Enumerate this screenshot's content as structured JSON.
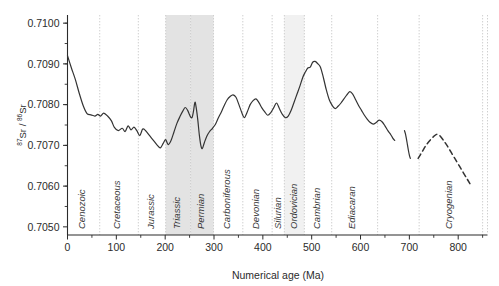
{
  "chart_data": {
    "type": "line",
    "title": "",
    "xlabel": "Numerical age (Ma)",
    "ylabel": "87Sr / 86Sr",
    "ylabel_parts": {
      "sup1": "87",
      "mid": "Sr / ",
      "sup2": "86",
      "end": "Sr"
    },
    "xlim": [
      0,
      860
    ],
    "ylim": [
      0.7048,
      0.7102
    ],
    "xticks_major": [
      0,
      100,
      200,
      300,
      400,
      500,
      600,
      700,
      800
    ],
    "xticks_major_labels": [
      "0",
      "100",
      "200",
      "300",
      "400",
      "500",
      "600",
      "700",
      "800"
    ],
    "xticks_minor": [
      50,
      150,
      250,
      350,
      450,
      550,
      650,
      750,
      850
    ],
    "yticks": [
      0.705,
      0.706,
      0.707,
      0.708,
      0.709,
      0.71
    ],
    "ytick_labels": [
      "0.7050",
      "0.7060",
      "0.7070",
      "0.7080",
      "0.7090",
      "0.7100"
    ],
    "grid": "vertical-dotted-period-boundaries",
    "legend": "none",
    "periods": [
      {
        "name": "Cenozoic",
        "start": 0,
        "end": 66,
        "shaded": false
      },
      {
        "name": "Cretaceous",
        "start": 66,
        "end": 145,
        "shaded": false
      },
      {
        "name": "Jurassic",
        "start": 145,
        "end": 201,
        "shaded": false
      },
      {
        "name": "Triassic",
        "start": 201,
        "end": 252,
        "shaded": true
      },
      {
        "name": "Permian",
        "start": 252,
        "end": 299,
        "shaded": true
      },
      {
        "name": "Carboniferous",
        "start": 299,
        "end": 359,
        "shaded": false
      },
      {
        "name": "Devonian",
        "start": 359,
        "end": 419,
        "shaded": false
      },
      {
        "name": "Silurian",
        "start": 419,
        "end": 444,
        "shaded": false
      },
      {
        "name": "Ordovician",
        "start": 444,
        "end": 485,
        "shaded": true
      },
      {
        "name": "Cambrian",
        "start": 485,
        "end": 541,
        "shaded": false
      },
      {
        "name": "Ediacaran",
        "start": 541,
        "end": 635,
        "shaded": false
      },
      {
        "name": "Cryogenian",
        "start": 720,
        "end": 850,
        "shaded": false
      }
    ],
    "series": [
      {
        "name": "seawater-87Sr/86Sr-solid",
        "style": "solid",
        "color": "#333333",
        "points": [
          [
            0,
            0.7092
          ],
          [
            8,
            0.7089
          ],
          [
            16,
            0.70862
          ],
          [
            24,
            0.70828
          ],
          [
            32,
            0.70798
          ],
          [
            40,
            0.70778
          ],
          [
            48,
            0.70775
          ],
          [
            56,
            0.70772
          ],
          [
            62,
            0.70776
          ],
          [
            68,
            0.70772
          ],
          [
            74,
            0.70779
          ],
          [
            82,
            0.70772
          ],
          [
            90,
            0.7076
          ],
          [
            96,
            0.70744
          ],
          [
            104,
            0.70736
          ],
          [
            112,
            0.70742
          ],
          [
            118,
            0.70734
          ],
          [
            124,
            0.70748
          ],
          [
            130,
            0.70738
          ],
          [
            136,
            0.70745
          ],
          [
            142,
            0.70736
          ],
          [
            148,
            0.70724
          ],
          [
            154,
            0.7074
          ],
          [
            160,
            0.70736
          ],
          [
            166,
            0.70727
          ],
          [
            172,
            0.70718
          ],
          [
            178,
            0.70709
          ],
          [
            184,
            0.707
          ],
          [
            190,
            0.70694
          ],
          [
            196,
            0.70705
          ],
          [
            201,
            0.70714
          ],
          [
            206,
            0.70702
          ],
          [
            212,
            0.70712
          ],
          [
            218,
            0.70733
          ],
          [
            224,
            0.70754
          ],
          [
            230,
            0.7077
          ],
          [
            236,
            0.70784
          ],
          [
            241,
            0.70793
          ],
          [
            246,
            0.70786
          ],
          [
            251,
            0.70772
          ],
          [
            255,
            0.70768
          ],
          [
            258,
            0.70784
          ],
          [
            261,
            0.70806
          ],
          [
            264,
            0.70789
          ],
          [
            267,
            0.7076
          ],
          [
            270,
            0.70725
          ],
          [
            273,
            0.707
          ],
          [
            276,
            0.70692
          ],
          [
            280,
            0.70706
          ],
          [
            285,
            0.70722
          ],
          [
            291,
            0.70734
          ],
          [
            297,
            0.70742
          ],
          [
            303,
            0.70752
          ],
          [
            309,
            0.70768
          ],
          [
            315,
            0.70782
          ],
          [
            321,
            0.70798
          ],
          [
            327,
            0.70812
          ],
          [
            333,
            0.7082
          ],
          [
            339,
            0.70824
          ],
          [
            345,
            0.70818
          ],
          [
            351,
            0.708
          ],
          [
            357,
            0.7078
          ],
          [
            362,
            0.70768
          ],
          [
            368,
            0.70782
          ],
          [
            374,
            0.708
          ],
          [
            380,
            0.7081
          ],
          [
            386,
            0.70814
          ],
          [
            392,
            0.70805
          ],
          [
            398,
            0.70792
          ],
          [
            404,
            0.70782
          ],
          [
            410,
            0.70774
          ],
          [
            416,
            0.7078
          ],
          [
            422,
            0.70792
          ],
          [
            428,
            0.70804
          ],
          [
            434,
            0.7079
          ],
          [
            440,
            0.70776
          ],
          [
            446,
            0.70768
          ],
          [
            452,
            0.70772
          ],
          [
            458,
            0.70786
          ],
          [
            464,
            0.70806
          ],
          [
            470,
            0.70826
          ],
          [
            476,
            0.70846
          ],
          [
            482,
            0.70868
          ],
          [
            487,
            0.7088
          ],
          [
            492,
            0.7089
          ],
          [
            497,
            0.70892
          ],
          [
            502,
            0.70904
          ],
          [
            507,
            0.70906
          ],
          [
            512,
            0.70901
          ],
          [
            518,
            0.70892
          ],
          [
            524,
            0.70866
          ],
          [
            530,
            0.70836
          ],
          [
            536,
            0.70812
          ],
          [
            542,
            0.70798
          ],
          [
            548,
            0.7079
          ],
          [
            554,
            0.70796
          ],
          [
            560,
            0.70804
          ],
          [
            566,
            0.70814
          ],
          [
            572,
            0.70824
          ],
          [
            578,
            0.70832
          ],
          [
            584,
            0.70826
          ],
          [
            590,
            0.70812
          ],
          [
            596,
            0.70798
          ],
          [
            602,
            0.70786
          ],
          [
            608,
            0.70774
          ],
          [
            614,
            0.70764
          ],
          [
            620,
            0.70756
          ],
          [
            626,
            0.70752
          ],
          [
            632,
            0.70756
          ],
          [
            638,
            0.70762
          ],
          [
            644,
            0.70758
          ],
          [
            650,
            0.70748
          ],
          [
            656,
            0.70736
          ],
          [
            662,
            0.70726
          ],
          [
            666,
            0.70718
          ],
          [
            670,
            0.70712
          ]
        ]
      },
      {
        "name": "seawater-87Sr/86Sr-solid-segment2",
        "style": "solid",
        "color": "#333333",
        "points": [
          [
            690,
            0.70736
          ],
          [
            692,
            0.70728
          ],
          [
            694,
            0.70716
          ],
          [
            696,
            0.70702
          ],
          [
            698,
            0.70688
          ],
          [
            700,
            0.70676
          ],
          [
            702,
            0.70668
          ]
        ]
      },
      {
        "name": "cryogenian-dashed",
        "style": "dashed",
        "color": "#333333",
        "points": [
          [
            718,
            0.70668
          ],
          [
            726,
            0.70684
          ],
          [
            734,
            0.707
          ],
          [
            742,
            0.70712
          ],
          [
            750,
            0.70722
          ],
          [
            756,
            0.70727
          ],
          [
            762,
            0.70724
          ],
          [
            770,
            0.70712
          ],
          [
            778,
            0.70698
          ],
          [
            786,
            0.70682
          ],
          [
            794,
            0.70666
          ],
          [
            802,
            0.7065
          ],
          [
            810,
            0.70634
          ],
          [
            818,
            0.70618
          ],
          [
            824,
            0.70606
          ]
        ]
      }
    ]
  },
  "colors": {
    "axis": "#2b2b2b",
    "curve": "#333333",
    "shade_strong": "#e3e3e3",
    "shade_light": "#f1f1f1",
    "divider": "#c9c9c9"
  }
}
